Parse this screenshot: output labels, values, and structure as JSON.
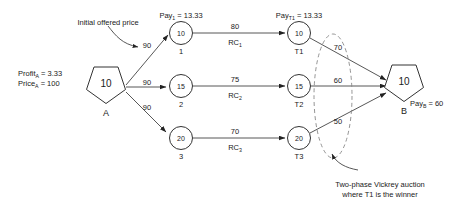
{
  "figure": {
    "caption_note": "Two-phase Vickrey auction network diagram"
  },
  "annotations": {
    "initial_offered_price": "Initial offered price",
    "bottom_note_line1": "Two-phase Vickrey auction",
    "bottom_note_line2": "where T1 is the winner"
  },
  "seller": {
    "node_value": "10",
    "node_name": "A",
    "profit_label": "Profit",
    "profit_sub": "A",
    "profit_value": " = 3.33",
    "price_label": "Price",
    "price_sub": "A",
    "price_value": " = 100"
  },
  "buyer": {
    "node_value": "10",
    "node_name": "B",
    "pay_label": "Pay",
    "pay_sub": "B",
    "pay_value": " = 60"
  },
  "pay_labels": {
    "pay1_label": "Pay",
    "pay1_sub": "1",
    "pay1_value": " = 13.33",
    "payT1_label": "Pay",
    "payT1_sub": "T1",
    "payT1_value": " = 13.33"
  },
  "offer_edges": [
    {
      "name": "offer-to-node-1",
      "price": "90"
    },
    {
      "name": "offer-to-node-2",
      "price": "90"
    },
    {
      "name": "offer-to-node-3",
      "price": "90"
    }
  ],
  "intermediate_nodes": [
    {
      "value": "10",
      "name": "1"
    },
    {
      "value": "15",
      "name": "2"
    },
    {
      "value": "20",
      "name": "3"
    }
  ],
  "rc_edges": [
    {
      "price": "80",
      "rc_label": "RC",
      "rc_sub": "1"
    },
    {
      "price": "75",
      "rc_label": "RC",
      "rc_sub": "2"
    },
    {
      "price": "70",
      "rc_label": "RC",
      "rc_sub": "3"
    }
  ],
  "terminal_nodes": [
    {
      "value": "10",
      "name": "T1"
    },
    {
      "value": "15",
      "name": "T2"
    },
    {
      "value": "20",
      "name": "T3"
    }
  ],
  "bid_edges": [
    {
      "name": "bid-T1-to-B",
      "price": "70"
    },
    {
      "name": "bid-T2-to-B",
      "price": "60"
    },
    {
      "name": "bid-T3-to-B",
      "price": "50"
    }
  ],
  "colors": {
    "stroke": "#333333",
    "text": "#1a1a1a",
    "dashed": "#777777",
    "background": "#ffffff"
  }
}
